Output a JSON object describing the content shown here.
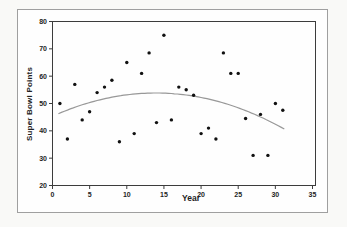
{
  "figure": {
    "background": "#f9f9f7",
    "frame_color": "#9f9f9f",
    "plot_background": "#fefefe"
  },
  "chart_data": {
    "type": "scatter",
    "title": "",
    "xlabel": "Year",
    "ylabel": "Super Bowl Points",
    "xlim": [
      0,
      35
    ],
    "ylim": [
      20,
      80
    ],
    "x_ticks": [
      0,
      5,
      10,
      15,
      20,
      25,
      30,
      35
    ],
    "y_ticks": [
      20,
      30,
      40,
      50,
      60,
      70,
      80
    ],
    "grid": false,
    "legend": "none",
    "axis_color": "#3c3c3c",
    "tick_label_color": "#1d1d1d",
    "point_color": "#111111",
    "x": [
      1,
      2,
      3,
      4,
      5,
      6,
      7,
      8,
      9,
      10,
      11,
      12,
      13,
      14,
      15,
      16,
      17,
      18,
      19,
      20,
      21,
      22,
      23,
      24,
      25,
      26,
      27,
      28,
      29,
      30,
      31
    ],
    "y": [
      50,
      37,
      57,
      44,
      47,
      54,
      56,
      58.5,
      36,
      65,
      39,
      61,
      68.5,
      43,
      75,
      44,
      56,
      55,
      53,
      39,
      41,
      37,
      68.5,
      61,
      61,
      44.5,
      31,
      46,
      31,
      50,
      47.5
    ],
    "trend_line": {
      "type": "quadratic",
      "a": -0.0441,
      "b": 1.2262,
      "c": 45.318,
      "x_start": 0.8,
      "x_end": 31.3,
      "color": "#989898"
    }
  }
}
